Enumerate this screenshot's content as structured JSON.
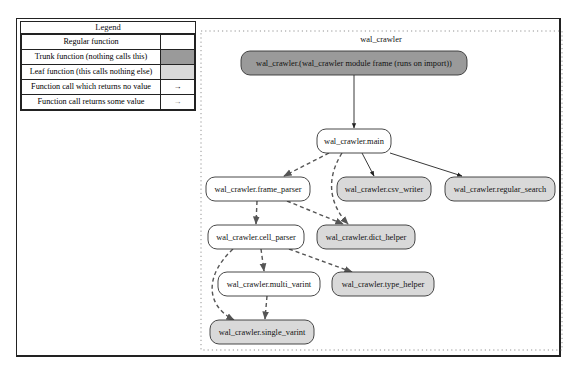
{
  "legend": {
    "title": "Legend",
    "rows": [
      {
        "label": "Regular function",
        "swatch": "",
        "color": "#ffffff"
      },
      {
        "label": "Trunk function (nothing calls this)",
        "swatch": "",
        "color": "#9a9a9a"
      },
      {
        "label": "Leaf function (this calls nothing else)",
        "swatch": "",
        "color": "#d9d9d9"
      },
      {
        "label": "Function call which returns no value",
        "swatch": "→",
        "color": "#ffffff"
      },
      {
        "label": "Function call returns some value",
        "swatch": "→",
        "color": "#ffffff"
      }
    ]
  },
  "cluster": {
    "label": "wal_crawler"
  },
  "colors": {
    "trunk": "#9a9a9a",
    "leaf": "#d9d9d9",
    "regular": "#ffffff",
    "edge": "#222222",
    "edge_dashed": "#555555"
  },
  "nodes": [
    {
      "id": "module",
      "label": "wal_crawler.(wal_crawler module frame (runs on import))",
      "kind": "trunk"
    },
    {
      "id": "main",
      "label": "wal_crawler.main",
      "kind": "regular"
    },
    {
      "id": "frame_parser",
      "label": "wal_crawler.frame_parser",
      "kind": "regular"
    },
    {
      "id": "csv_writer",
      "label": "wal_crawler.csv_writer",
      "kind": "leaf"
    },
    {
      "id": "regular_search",
      "label": "wal_crawler.regular_search",
      "kind": "leaf"
    },
    {
      "id": "cell_parser",
      "label": "wal_crawler.cell_parser",
      "kind": "regular"
    },
    {
      "id": "dict_helper",
      "label": "wal_crawler.dict_helper",
      "kind": "leaf"
    },
    {
      "id": "multi_varint",
      "label": "wal_crawler.multi_varint",
      "kind": "regular"
    },
    {
      "id": "type_helper",
      "label": "wal_crawler.type_helper",
      "kind": "leaf"
    },
    {
      "id": "single_varint",
      "label": "wal_crawler.single_varint",
      "kind": "leaf"
    }
  ],
  "edges": [
    {
      "from": "module",
      "to": "main",
      "returns_value": false
    },
    {
      "from": "main",
      "to": "frame_parser",
      "returns_value": true
    },
    {
      "from": "main",
      "to": "dict_helper",
      "returns_value": true
    },
    {
      "from": "main",
      "to": "csv_writer",
      "returns_value": false
    },
    {
      "from": "main",
      "to": "regular_search",
      "returns_value": false
    },
    {
      "from": "frame_parser",
      "to": "cell_parser",
      "returns_value": true
    },
    {
      "from": "frame_parser",
      "to": "dict_helper",
      "returns_value": true
    },
    {
      "from": "cell_parser",
      "to": "multi_varint",
      "returns_value": true
    },
    {
      "from": "cell_parser",
      "to": "type_helper",
      "returns_value": true
    },
    {
      "from": "cell_parser",
      "to": "single_varint",
      "returns_value": true
    },
    {
      "from": "multi_varint",
      "to": "single_varint",
      "returns_value": true
    }
  ]
}
